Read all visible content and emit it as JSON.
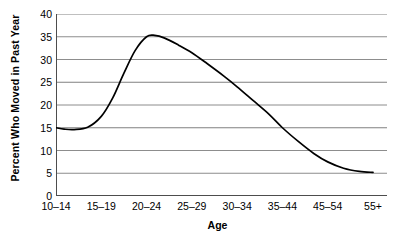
{
  "chart_data": {
    "type": "line",
    "title": "",
    "subtitle": "",
    "xlabel": "Age",
    "ylabel": "Percent Who Moved in Past Year",
    "categories": [
      "10–14",
      "15–19",
      "20–24",
      "25–29",
      "30–34",
      "35–44",
      "45–54",
      "55+"
    ],
    "values": [
      15.0,
      17.5,
      35.0,
      31.5,
      24.0,
      15.0,
      7.5,
      5.2
    ],
    "series": [
      {
        "name": "Percent Who Moved in Past Year",
        "values": [
          15.0,
          17.5,
          35.0,
          31.5,
          24.0,
          15.0,
          7.5,
          5.2
        ]
      }
    ],
    "peak": {
      "category": "20–24",
      "value": 35.3
    },
    "minimum": {
      "category": "55+",
      "value": 5.2
    },
    "ylim": [
      0,
      40
    ],
    "ytick_labels": [
      "0",
      "5",
      "10",
      "15",
      "20",
      "25",
      "30",
      "35",
      "40"
    ],
    "ytick_values": [
      0,
      5,
      10,
      15,
      20,
      25,
      30,
      35,
      40
    ],
    "xtick_labels": [
      "10–14",
      "15–19",
      "20–24",
      "25–29",
      "30–34",
      "35–44",
      "45–54",
      "55+"
    ],
    "grid": true,
    "grid_axis": "y",
    "legend": "none",
    "line_color": "#000000",
    "grid_color": "#808080",
    "axis_color": "#4d4d4d",
    "background_color": "#ffffff",
    "smoothing": "spline",
    "curve_points": [
      {
        "x": 0.0,
        "y": 15.0
      },
      {
        "x": 0.18,
        "y": 14.7
      },
      {
        "x": 0.4,
        "y": 14.6
      },
      {
        "x": 0.7,
        "y": 15.1
      },
      {
        "x": 1.0,
        "y": 17.5
      },
      {
        "x": 1.25,
        "y": 21.5
      },
      {
        "x": 1.5,
        "y": 27.0
      },
      {
        "x": 1.75,
        "y": 32.0
      },
      {
        "x": 2.0,
        "y": 35.0
      },
      {
        "x": 2.18,
        "y": 35.3
      },
      {
        "x": 2.4,
        "y": 34.7
      },
      {
        "x": 2.7,
        "y": 33.2
      },
      {
        "x": 3.0,
        "y": 31.5
      },
      {
        "x": 3.35,
        "y": 29.0
      },
      {
        "x": 3.7,
        "y": 26.4
      },
      {
        "x": 4.0,
        "y": 24.0
      },
      {
        "x": 4.35,
        "y": 21.0
      },
      {
        "x": 4.7,
        "y": 18.0
      },
      {
        "x": 5.0,
        "y": 15.0
      },
      {
        "x": 5.35,
        "y": 12.0
      },
      {
        "x": 5.7,
        "y": 9.3
      },
      {
        "x": 6.0,
        "y": 7.5
      },
      {
        "x": 6.35,
        "y": 6.1
      },
      {
        "x": 6.7,
        "y": 5.4
      },
      {
        "x": 7.0,
        "y": 5.2
      }
    ]
  }
}
